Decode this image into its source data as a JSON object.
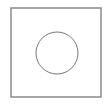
{
  "canvas": {
    "width": 107,
    "height": 106,
    "background": "#ffffff"
  },
  "shapes": {
    "square": {
      "x": 11,
      "y": 8,
      "width": 90,
      "height": 89,
      "stroke": "#8a8a8a",
      "stroke_width": 1.5
    },
    "circle": {
      "cx": 57,
      "cy": 53,
      "r": 21,
      "stroke": "#7a7a7a",
      "stroke_width": 1
    }
  }
}
